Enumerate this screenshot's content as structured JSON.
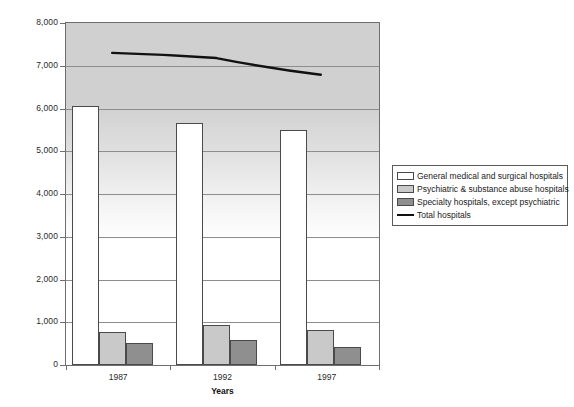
{
  "chart_data": {
    "type": "bar",
    "title": "",
    "xlabel": "Years",
    "ylabel": "",
    "categories": [
      "1987",
      "1992",
      "1997"
    ],
    "ylim": [
      0,
      8000
    ],
    "ytick_labels": [
      "8,000",
      "7,000",
      "6,000",
      "5,000",
      "4,000",
      "3,000",
      "2,000",
      "1,000",
      "0"
    ],
    "ytick_values": [
      8000,
      7000,
      6000,
      5000,
      4000,
      3000,
      2000,
      1000,
      0
    ],
    "grid": true,
    "legend_position": "right",
    "series": [
      {
        "name": "General medical and surgical hospitals",
        "kind": "bar",
        "color": "#ffffff",
        "values": [
          6050,
          5650,
          5500
        ]
      },
      {
        "name": "Psychiatric & substance abuse hospitals",
        "kind": "bar",
        "color": "#c9c9c9",
        "values": [
          780,
          930,
          820
        ]
      },
      {
        "name": "Specialty hospitals, except psychiatric",
        "kind": "bar",
        "color": "#8f8f8f",
        "values": [
          520,
          590,
          430
        ]
      },
      {
        "name": "Total hospitals",
        "kind": "line",
        "color": "#111111",
        "values": [
          7300,
          7180,
          6790
        ]
      }
    ]
  },
  "legend": {
    "items": [
      {
        "label": "General medical and surgical hospitals",
        "swatch": "series0"
      },
      {
        "label": "Psychiatric & substance abuse hospitals",
        "swatch": "series1"
      },
      {
        "label": "Specialty hospitals, except psychiatric",
        "swatch": "series2"
      },
      {
        "label": "Total hospitals",
        "swatch": "line"
      }
    ]
  },
  "axis": {
    "x_title": "Years"
  }
}
